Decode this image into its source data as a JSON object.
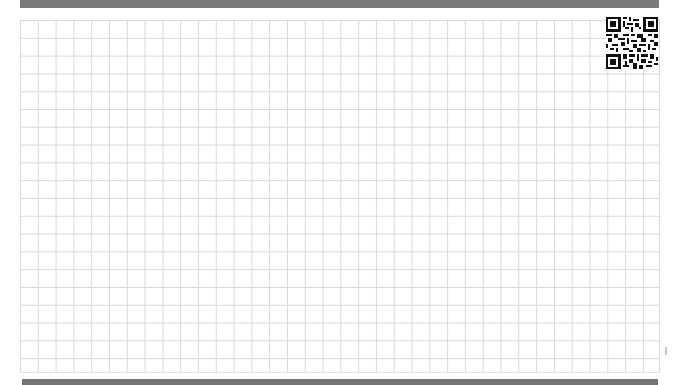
{
  "page": {
    "type": "graph-paper-sheet",
    "background": "#ffffff",
    "grid": {
      "line_color": "#d9d9d9",
      "cell_size_px": 17.8,
      "columns": 36,
      "rows": 20
    },
    "top_bar": {
      "color": "#7a7a7a"
    },
    "bottom_bar": {
      "color": "#757575"
    },
    "qr_code": {
      "label": ""
    }
  }
}
